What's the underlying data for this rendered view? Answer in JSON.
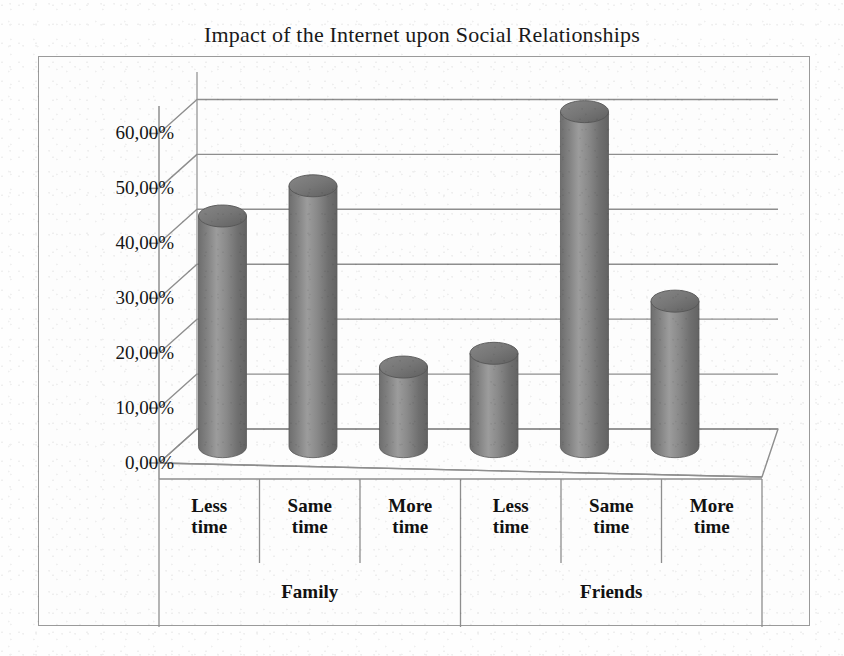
{
  "chart_data": {
    "type": "bar",
    "title": "Impact of the Internet upon Social Relationships",
    "xlabel": "",
    "ylabel": "",
    "ylim": [
      0,
      65
    ],
    "grid": true,
    "legend": "none",
    "style": "3d-cylinder",
    "bar_color": "#7c7c7c",
    "categories": [
      "Less time",
      "Same time",
      "More time",
      "Less time",
      "Same time",
      "More time"
    ],
    "groups": [
      {
        "label": "Family",
        "categories": [
          "Less time",
          "Same time",
          "More time"
        ],
        "values": [
          42.0,
          47.5,
          14.5
        ]
      },
      {
        "label": "Friends",
        "categories": [
          "Less time",
          "Same time",
          "More time"
        ],
        "values": [
          17.0,
          61.0,
          26.5
        ]
      }
    ],
    "values": [
      42.0,
      47.5,
      14.5,
      17.0,
      61.0,
      26.5
    ],
    "ytick_values": [
      0,
      10,
      20,
      30,
      40,
      50,
      60
    ],
    "ytick_labels": [
      "0,00%",
      "10,00%",
      "20,00%",
      "30,00%",
      "40,00%",
      "50,00%",
      "60,00%"
    ]
  },
  "axis": {
    "y_ticks": [
      {
        "label": "60,00%",
        "value": 60
      },
      {
        "label": "50,00%",
        "value": 50
      },
      {
        "label": "40,00%",
        "value": 40
      },
      {
        "label": "30,00%",
        "value": 30
      },
      {
        "label": "20,00%",
        "value": 20
      },
      {
        "label": "10,00%",
        "value": 10
      },
      {
        "label": "0,00%",
        "value": 0
      }
    ]
  },
  "categories": [
    {
      "line1": "Less",
      "line2": "time"
    },
    {
      "line1": "Same",
      "line2": "time"
    },
    {
      "line1": "More",
      "line2": "time"
    },
    {
      "line1": "Less",
      "line2": "time"
    },
    {
      "line1": "Same",
      "line2": "time"
    },
    {
      "line1": "More",
      "line2": "time"
    }
  ],
  "groups": [
    {
      "label": "Family"
    },
    {
      "label": "Friends"
    }
  ],
  "colors": {
    "bar": "#7c7c7c",
    "bar_highlight": "#9d9d9d",
    "bar_shadow": "#5f5f5f",
    "grid": "#8e8e8e",
    "frame": "#9a9a9a",
    "text": "#111111"
  }
}
